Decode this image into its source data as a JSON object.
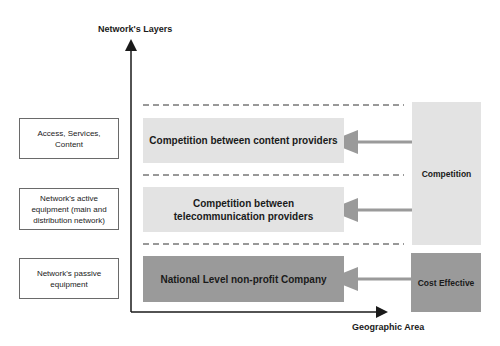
{
  "axes": {
    "y_label": "Network's Layers",
    "x_label": "Geographic Area"
  },
  "layers": [
    {
      "label": "Access, Services, Content"
    },
    {
      "label": "Network's active equipment (main and distribution network)"
    },
    {
      "label": "Network's passive equipment"
    }
  ],
  "blocks": [
    {
      "label": "Competition between content providers",
      "shade": "light"
    },
    {
      "label": "Competition between telecommunication providers",
      "shade": "light"
    },
    {
      "label": "National Level non-profit Company",
      "shade": "dark"
    }
  ],
  "side_blocks": [
    {
      "label": "Competition",
      "shade": "light"
    },
    {
      "label": "Cost Effective",
      "shade": "dark"
    }
  ],
  "colors": {
    "light_fill": "#e3e3e3",
    "dark_fill": "#9a9a9a",
    "arrow": "#9a9a9a",
    "axis": "#1a1a1a"
  }
}
